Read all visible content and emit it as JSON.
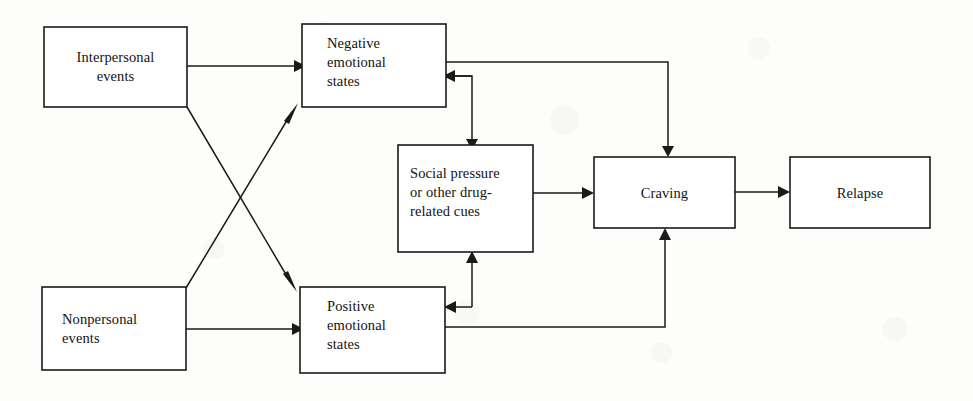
{
  "diagram": {
    "type": "flowchart",
    "canvas": {
      "width": 973,
      "height": 401
    },
    "style": {
      "background_color": "#fdfdfc",
      "line_color": "#1a1a18",
      "box_fill": "#ffffff",
      "text_color": "#14130f"
    },
    "nodes": [
      {
        "id": "interpersonal",
        "label_lines": [
          "Interpersonal",
          "events"
        ],
        "align": "center",
        "x": 44,
        "y": 27,
        "w": 143,
        "h": 80
      },
      {
        "id": "nonpersonal",
        "label_lines": [
          "Nonpersonal",
          "events"
        ],
        "align": "left",
        "x": 42,
        "y": 287,
        "w": 144,
        "h": 83
      },
      {
        "id": "negative",
        "label_lines": [
          "Negative",
          "emotional",
          "states"
        ],
        "align": "left",
        "x": 302,
        "y": 24,
        "w": 144,
        "h": 83
      },
      {
        "id": "positive",
        "label_lines": [
          "Positive",
          "emotional",
          "states"
        ],
        "align": "left",
        "x": 300,
        "y": 287,
        "w": 145,
        "h": 86
      },
      {
        "id": "social_pressure",
        "label_lines": [
          "Social pressure",
          "or other drug-",
          "related cues"
        ],
        "align": "left",
        "x": 398,
        "y": 145,
        "w": 135,
        "h": 107
      },
      {
        "id": "craving",
        "label_lines": [
          "Craving"
        ],
        "align": "center",
        "x": 594,
        "y": 157,
        "w": 141,
        "h": 71
      },
      {
        "id": "relapse",
        "label_lines": [
          "Relapse"
        ],
        "align": "center",
        "x": 790,
        "y": 157,
        "w": 140,
        "h": 71
      }
    ],
    "edges": [
      {
        "id": "e1",
        "from": "interpersonal",
        "to": "negative",
        "description": "Interpersonal events to Negative emotional states"
      },
      {
        "id": "e2",
        "from": "interpersonal",
        "to": "positive",
        "description": "Interpersonal events to Positive emotional states"
      },
      {
        "id": "e3",
        "from": "nonpersonal",
        "to": "negative",
        "description": "Nonpersonal events to Negative emotional states"
      },
      {
        "id": "e4",
        "from": "nonpersonal",
        "to": "positive",
        "description": "Nonpersonal events to Positive emotional states"
      },
      {
        "id": "e5",
        "from": "negative",
        "to": "social_pressure",
        "description": "Negative emotional states to Social pressure or other drug-related cues"
      },
      {
        "id": "e6",
        "from": "social_pressure",
        "to": "negative",
        "description": "Social pressure or other drug-related cues to Negative emotional states"
      },
      {
        "id": "e7",
        "from": "social_pressure",
        "to": "positive",
        "description": "Social pressure or other drug-related cues to Positive emotional states"
      },
      {
        "id": "e8",
        "from": "positive",
        "to": "social_pressure",
        "description": "Positive emotional states to Social pressure or other drug-related cues"
      },
      {
        "id": "e9",
        "from": "social_pressure",
        "to": "craving",
        "description": "Social pressure or other drug-related cues to Craving"
      },
      {
        "id": "e10",
        "from": "negative",
        "to": "craving",
        "description": "Negative emotional states to Craving"
      },
      {
        "id": "e11",
        "from": "positive",
        "to": "craving",
        "description": "Positive emotional states to Craving"
      },
      {
        "id": "e12",
        "from": "craving",
        "to": "relapse",
        "description": "Craving to Relapse"
      }
    ]
  }
}
